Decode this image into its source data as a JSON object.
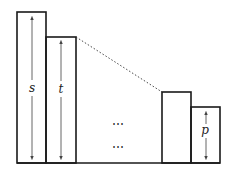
{
  "diagram": {
    "type": "bar-stack-illustration",
    "colors": {
      "stroke": "#1a1a1a",
      "arrow": "#555555",
      "background": "#ffffff"
    },
    "bars": [
      {
        "id": "bar-s",
        "label": "s",
        "x": 17,
        "top": 12,
        "width": 29,
        "has_arrow": true
      },
      {
        "id": "bar-t",
        "label": "t",
        "x": 46,
        "top": 37,
        "width": 30,
        "has_arrow": true
      },
      {
        "id": "bar-3",
        "label": "",
        "x": 162,
        "top": 92,
        "width": 29,
        "has_arrow": false
      },
      {
        "id": "bar-p",
        "label": "p",
        "x": 191,
        "top": 107,
        "width": 29,
        "has_arrow": true
      }
    ],
    "baseline_y": 163,
    "ellipsis": [
      "⋯",
      "⋯"
    ],
    "dotted_connector": {
      "from": [
        76,
        37
      ],
      "to": [
        162,
        92
      ]
    }
  }
}
